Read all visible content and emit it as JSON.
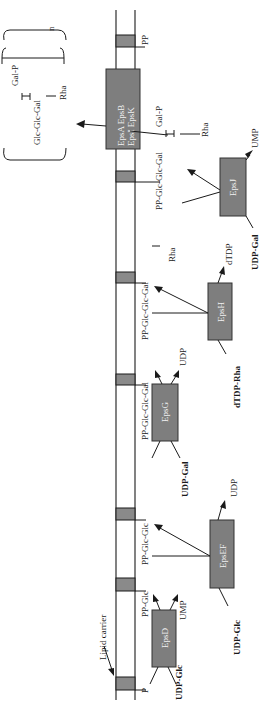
{
  "diagram": {
    "colors": {
      "segment": "#8a8a8a",
      "enzyme_box": "#7e7e7e",
      "line": "#1a1a1a",
      "box_text": "#f2f2f2"
    },
    "lipid_carrier_label": "Lipid carrier",
    "carrier_segments": [
      {
        "label": "PP"
      },
      {
        "label": ""
      },
      {
        "label": "PP-Glc-Glc-Gal"
      },
      {
        "label": "PP-Glc-Glc-Gal"
      },
      {
        "label": "PP-Glc-Glc"
      },
      {
        "label": "PP-Glc"
      },
      {
        "label": "P"
      }
    ],
    "enzymes": {
      "epsABIK": {
        "line1": "EpsA  EpsB",
        "line2": "EpsI  EpsK"
      },
      "epsJ": {
        "name": "EpsJ",
        "substrate": "UDP-Gal",
        "product": "UMP"
      },
      "epsH": {
        "name": "EpsH",
        "substrate": "dTDP-Rha",
        "product": "dTDP"
      },
      "epsG": {
        "name": "EpsG",
        "substrate": "UDP-Gal",
        "product": "UDP"
      },
      "epsEF": {
        "name": "EpsEF",
        "substrate": "UDP-Glc",
        "product": "UDP"
      },
      "epsD": {
        "name": "EpsD",
        "substrate": "UDP-Glc",
        "product": "UMP"
      }
    },
    "branch_labels": {
      "gal_p": "Gal-P",
      "rha": "Rha"
    },
    "polymer": {
      "backbone": "Glc-Glc-Gal",
      "branch_top": "Gal-P",
      "branch_bottom": "Rha",
      "repeat": "n"
    }
  }
}
